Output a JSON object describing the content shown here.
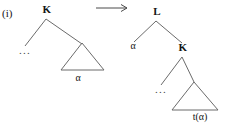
{
  "figure": {
    "case_label": "(i)",
    "transform_arrow": "arrow-right"
  },
  "left_tree": {
    "root_label": "K",
    "left_child_label": "...",
    "right_subtree_label": "α"
  },
  "right_tree": {
    "root_label": "L",
    "left_child_label": "α",
    "right_child_label": "K",
    "right_child_left_label": "...",
    "right_child_subtree_label": "t(α)"
  },
  "style": {
    "line_color": "#5a5a5a",
    "text_color": "#151515",
    "background": "#ffffff"
  }
}
